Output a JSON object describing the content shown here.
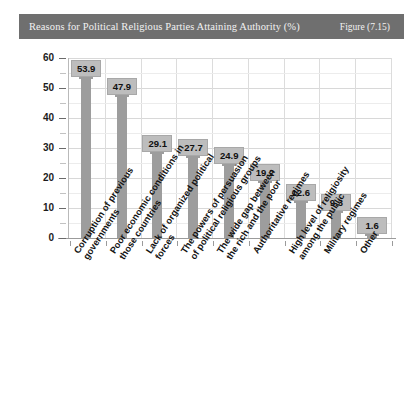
{
  "header": {
    "title": "Reasons for Political Religious Parties Attaining Authority (%)",
    "figure_label": "Figure (7.15)",
    "bar_color": "#6f6f6f",
    "text_color": "#f2f2f2"
  },
  "chart_data": {
    "type": "bar",
    "title": "Reasons for Political Religious Parties Attaining Authority (%)",
    "xlabel": "",
    "ylabel": "",
    "ylim": [
      0,
      60
    ],
    "ytick_labels": [
      "0",
      "10",
      "20",
      "30",
      "40",
      "50",
      "60"
    ],
    "ytick_values": [
      0,
      10,
      20,
      30,
      40,
      50,
      60
    ],
    "minor_tick_step": 5,
    "grid": "horizontal-major-and-vertical-category-separators",
    "legend": "none",
    "series_color": "#9d9d9d",
    "value_label_bg": "#bdbdbd",
    "categories": [
      "Corruption of previous governments",
      "Poor economic conditions in those countries",
      "Lack of organized political forces",
      "The powers of persuasion of political religious groups",
      "The wide gap between the rich and the poor",
      "Authoritative regimes",
      "High level of religiosity among the public",
      "Military regimes",
      "Other"
    ],
    "category_lines": [
      [
        "Corruption of previous",
        "governments"
      ],
      [
        "Poor economic conditions in",
        "those countries"
      ],
      [
        "Lack of organized political",
        "forces"
      ],
      [
        "The powers of persuasion",
        "of political religious groups"
      ],
      [
        "The wide gap between",
        "the rich and the poor"
      ],
      [
        "Authoritative regimes"
      ],
      [
        "High level of religiosity",
        "among the public"
      ],
      [
        "Military regimes"
      ],
      [
        "Other"
      ]
    ],
    "values": [
      53.9,
      47.9,
      29.1,
      27.7,
      24.9,
      19.2,
      12.6,
      9.3,
      1.6
    ],
    "value_labels": [
      "53.9",
      "47.9",
      "29.1",
      "27.7",
      "24.9",
      "19.2",
      "12.6",
      "9.3",
      "1.6"
    ]
  }
}
